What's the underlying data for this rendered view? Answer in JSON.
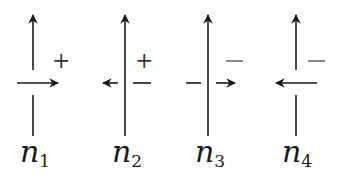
{
  "diagram": {
    "stroke_color": "#1a1a1a",
    "crossings": [
      {
        "id": "n1",
        "label_base": "n",
        "label_sub": "1",
        "cx": 33,
        "over_strand": "horizontal",
        "horizontal_arrow": "right",
        "vertical_arrow": "up",
        "sign": "+"
      },
      {
        "id": "n2",
        "label_base": "n",
        "label_sub": "2",
        "cx": 125,
        "over_strand": "vertical",
        "horizontal_arrow": "left",
        "vertical_arrow": "up",
        "sign": "+",
        "extra_mark": "−"
      },
      {
        "id": "n3",
        "label_base": "n",
        "label_sub": "3",
        "cx": 208,
        "over_strand": "vertical",
        "horizontal_arrow": "right",
        "vertical_arrow": "up",
        "sign": "−"
      },
      {
        "id": "n4",
        "label_base": "n",
        "label_sub": "4",
        "cx": 296,
        "over_strand": "horizontal",
        "horizontal_arrow": "left",
        "vertical_arrow": "up",
        "sign": "−"
      }
    ]
  }
}
